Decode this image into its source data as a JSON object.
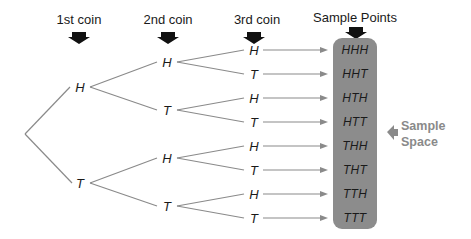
{
  "headers": {
    "coin1": "1st coin",
    "coin2": "2nd coin",
    "coin3": "3rd coin",
    "sample_points": "Sample Points"
  },
  "tree": {
    "level1": [
      "H",
      "T"
    ],
    "level2": [
      "H",
      "T",
      "H",
      "T"
    ],
    "level3": [
      "H",
      "T",
      "H",
      "T",
      "H",
      "T",
      "H",
      "T"
    ]
  },
  "sample_points": [
    "HHH",
    "HHT",
    "HTH",
    "HTT",
    "THH",
    "THT",
    "TTH",
    "TTT"
  ],
  "sample_space_label": {
    "line1": "Sample",
    "line2": "Space"
  },
  "colors": {
    "line": "#8a8a8a",
    "box": "#8c8c8c",
    "text": "#1a1a1a",
    "label": "#8a8a8a",
    "header_arrow": "#111111"
  }
}
